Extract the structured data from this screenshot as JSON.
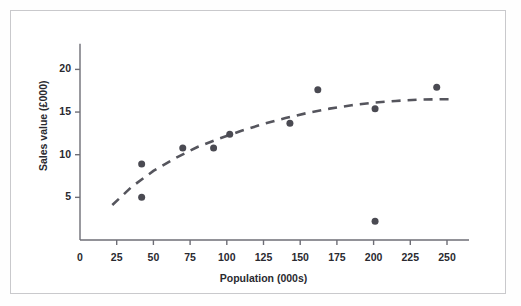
{
  "figure": {
    "background_color": "#ffffff",
    "border_color": "#c9c9cc",
    "marker_color": "#4a4a52",
    "trendline_color": "#55555d",
    "axis_color": "#6e6e76",
    "text_color": "#2a2a30"
  },
  "chart_data": {
    "type": "scatter",
    "title": "",
    "xlabel": "Population (000s)",
    "ylabel": "Sales value (£000)",
    "xlim": [
      0,
      265
    ],
    "ylim": [
      0,
      23
    ],
    "grid": false,
    "legend": null,
    "xticks": [
      0,
      25,
      50,
      75,
      100,
      125,
      150,
      175,
      200,
      225,
      250
    ],
    "xtick_labels": [
      "0",
      "25",
      "50",
      "75",
      "100",
      "125",
      "150",
      "175",
      "200",
      "225",
      "250"
    ],
    "yticks": [
      5,
      10,
      15,
      20
    ],
    "ytick_labels": [
      "5",
      "10",
      "15",
      "20"
    ],
    "points": [
      {
        "x": 42,
        "y": 8.9
      },
      {
        "x": 42,
        "y": 5.0
      },
      {
        "x": 70,
        "y": 10.8
      },
      {
        "x": 91,
        "y": 10.8
      },
      {
        "x": 102,
        "y": 12.4
      },
      {
        "x": 143,
        "y": 13.7
      },
      {
        "x": 162,
        "y": 17.6
      },
      {
        "x": 201,
        "y": 15.4
      },
      {
        "x": 201,
        "y": 2.2
      },
      {
        "x": 243,
        "y": 17.9
      }
    ],
    "marker_size_px": 7,
    "series": [
      {
        "name": "trendline",
        "style": "dashed",
        "x": [
          22,
          35,
          50,
          65,
          80,
          95,
          110,
          125,
          140,
          155,
          170,
          185,
          200,
          215,
          230,
          245,
          253
        ],
        "y": [
          4.1,
          6.2,
          8.1,
          9.6,
          10.9,
          11.9,
          12.8,
          13.6,
          14.3,
          14.9,
          15.4,
          15.8,
          16.1,
          16.3,
          16.45,
          16.5,
          16.5
        ]
      }
    ]
  }
}
